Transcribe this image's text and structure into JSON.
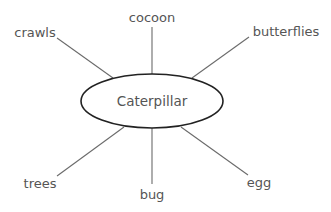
{
  "diagram": {
    "type": "spider-map",
    "center": {
      "label": "Caterpillar"
    },
    "nodes": [
      {
        "id": "cocoon",
        "label": "cocoon"
      },
      {
        "id": "crawls",
        "label": "crawls"
      },
      {
        "id": "butterflies",
        "label": "butterflies"
      },
      {
        "id": "trees",
        "label": "trees"
      },
      {
        "id": "bug",
        "label": "bug"
      },
      {
        "id": "egg",
        "label": "egg"
      }
    ],
    "colors": {
      "text": "#555555",
      "spoke": "#6b6b6b",
      "ellipse_stroke": "#222222"
    }
  }
}
